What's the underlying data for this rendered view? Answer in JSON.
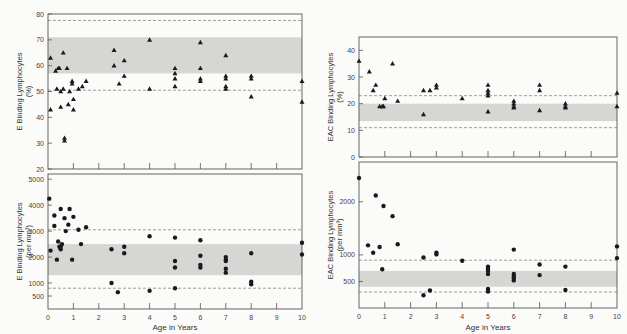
{
  "figure": {
    "x_axis_title": "Age in Years",
    "x_ticks": [
      "0",
      "1",
      "2",
      "3",
      "4",
      "5",
      "6",
      "7",
      "8",
      "9",
      "10"
    ]
  },
  "colors": {
    "band": "#d6d6d4",
    "frame": "#555555",
    "marker": "#1a1a1a",
    "dashed": "#777777",
    "background": "#fbfbf9"
  },
  "chart_data": [
    {
      "id": "e-percent",
      "type": "scatter",
      "marker": "triangle",
      "title": "",
      "ylabel": "E Binding Lymphocytes (%)",
      "ylabel_line1": "E  Binding Lymphocytes",
      "ylabel_line2": "(%)",
      "xlabel": "",
      "xlim": [
        0,
        10
      ],
      "ylim": [
        20,
        80
      ],
      "yticks": [
        20,
        30,
        40,
        50,
        60,
        70,
        80
      ],
      "band": [
        57,
        71
      ],
      "dashed": [
        77.5,
        50.5
      ],
      "points": [
        [
          0.1,
          63
        ],
        [
          0.1,
          43
        ],
        [
          0.3,
          58
        ],
        [
          0.35,
          51
        ],
        [
          0.4,
          59
        ],
        [
          0.45,
          59
        ],
        [
          0.5,
          44
        ],
        [
          0.5,
          50
        ],
        [
          0.6,
          65
        ],
        [
          0.6,
          51
        ],
        [
          0.65,
          32
        ],
        [
          0.65,
          31
        ],
        [
          0.75,
          59
        ],
        [
          0.8,
          45
        ],
        [
          0.85,
          50
        ],
        [
          0.95,
          54
        ],
        [
          0.95,
          53
        ],
        [
          1.0,
          47
        ],
        [
          1.0,
          43
        ],
        [
          1.2,
          51
        ],
        [
          1.35,
          52
        ],
        [
          1.5,
          54
        ],
        [
          2.6,
          66
        ],
        [
          2.6,
          60
        ],
        [
          2.8,
          53
        ],
        [
          3.0,
          62
        ],
        [
          3.0,
          56
        ],
        [
          4.0,
          70
        ],
        [
          4.0,
          51
        ],
        [
          5.0,
          59
        ],
        [
          5.0,
          57
        ],
        [
          5.0,
          55
        ],
        [
          5.0,
          52
        ],
        [
          6.0,
          69
        ],
        [
          6.0,
          59
        ],
        [
          6.0,
          55
        ],
        [
          6.0,
          54
        ],
        [
          7.0,
          64
        ],
        [
          7.0,
          56
        ],
        [
          7.0,
          55
        ],
        [
          7.0,
          52
        ],
        [
          7.0,
          51
        ],
        [
          8.0,
          56
        ],
        [
          8.0,
          55
        ],
        [
          8.0,
          48
        ],
        [
          10.0,
          54
        ],
        [
          10.0,
          46
        ]
      ]
    },
    {
      "id": "e-absolute",
      "type": "scatter",
      "marker": "circle",
      "title": "",
      "ylabel": "E Binding Lymphocytes (per mm3)",
      "ylabel_line1": "E  Binding Lymphocytes",
      "ylabel_line2": "(per mm³)",
      "xlabel": "Age in Years",
      "xlim": [
        0,
        10
      ],
      "ylim": [
        0,
        5200
      ],
      "yticks": [
        500,
        1000,
        2000,
        3000,
        4000,
        5000
      ],
      "band": [
        1300,
        2500
      ],
      "dashed": [
        3050,
        800
      ],
      "points": [
        [
          0.05,
          4250
        ],
        [
          0.1,
          2250
        ],
        [
          0.25,
          3600
        ],
        [
          0.25,
          3200
        ],
        [
          0.35,
          1900
        ],
        [
          0.4,
          2600
        ],
        [
          0.45,
          2400
        ],
        [
          0.5,
          2300
        ],
        [
          0.5,
          2400
        ],
        [
          0.5,
          3850
        ],
        [
          0.55,
          2500
        ],
        [
          0.65,
          3500
        ],
        [
          0.7,
          3000
        ],
        [
          0.8,
          3250
        ],
        [
          0.85,
          3850
        ],
        [
          0.95,
          1900
        ],
        [
          1.0,
          3550
        ],
        [
          1.2,
          3050
        ],
        [
          1.3,
          2500
        ],
        [
          1.5,
          3150
        ],
        [
          2.5,
          2300
        ],
        [
          2.5,
          1000
        ],
        [
          2.75,
          650
        ],
        [
          3.0,
          2400
        ],
        [
          3.0,
          2150
        ],
        [
          4.0,
          2800
        ],
        [
          4.0,
          700
        ],
        [
          5.0,
          2750
        ],
        [
          5.0,
          1850
        ],
        [
          5.0,
          1600
        ],
        [
          5.0,
          800
        ],
        [
          6.0,
          2650
        ],
        [
          6.0,
          2050
        ],
        [
          6.0,
          1700
        ],
        [
          6.0,
          1600
        ],
        [
          7.0,
          2000
        ],
        [
          7.0,
          1900
        ],
        [
          7.0,
          1850
        ],
        [
          7.0,
          1550
        ],
        [
          7.0,
          1400
        ],
        [
          8.0,
          2150
        ],
        [
          8.0,
          1050
        ],
        [
          8.0,
          950
        ],
        [
          10.0,
          2550
        ],
        [
          10.0,
          2100
        ]
      ]
    },
    {
      "id": "eac-percent",
      "type": "scatter",
      "marker": "triangle",
      "title": "",
      "ylabel": "EAC Binding Lymphocytes (%)",
      "ylabel_line1": "EAC  Binding Lymphocytes",
      "ylabel_line2": "(%)",
      "xlabel": "",
      "xlim": [
        0,
        10
      ],
      "ylim": [
        0,
        45
      ],
      "yticks": [
        0,
        10,
        20,
        30,
        40
      ],
      "band": [
        13.5,
        20
      ],
      "dashed": [
        23,
        11
      ],
      "points": [
        [
          0.0,
          36
        ],
        [
          0.4,
          32
        ],
        [
          0.55,
          25
        ],
        [
          0.65,
          27
        ],
        [
          0.8,
          19
        ],
        [
          0.9,
          19
        ],
        [
          0.95,
          19
        ],
        [
          1.0,
          22
        ],
        [
          1.3,
          35
        ],
        [
          1.5,
          21
        ],
        [
          2.5,
          25
        ],
        [
          2.5,
          16
        ],
        [
          2.75,
          25
        ],
        [
          3.0,
          27
        ],
        [
          3.0,
          26
        ],
        [
          4.0,
          22
        ],
        [
          5.0,
          27
        ],
        [
          5.0,
          25
        ],
        [
          5.0,
          24
        ],
        [
          5.0,
          23
        ],
        [
          5.0,
          17
        ],
        [
          6.0,
          21
        ],
        [
          6.0,
          20
        ],
        [
          6.0,
          19
        ],
        [
          6.0,
          18.5
        ],
        [
          7.0,
          27
        ],
        [
          7.0,
          25
        ],
        [
          7.0,
          17.5
        ],
        [
          8.0,
          20
        ],
        [
          8.0,
          19
        ],
        [
          8.0,
          18.5
        ],
        [
          10.0,
          24
        ],
        [
          10.0,
          19
        ]
      ]
    },
    {
      "id": "eac-absolute",
      "type": "scatter",
      "marker": "circle",
      "title": "",
      "ylabel": "EAC Binding Lymphocytes (per mm3)",
      "ylabel_line1": "EAC  Binding Lymphocytes",
      "ylabel_line2": "(per mm³)",
      "xlabel": "Age in Years",
      "xlim": [
        0,
        10
      ],
      "ylim": [
        0,
        2750
      ],
      "yticks": [
        500,
        1000,
        2000
      ],
      "band": [
        400,
        700
      ],
      "dashed": [
        900,
        300
      ],
      "points": [
        [
          0.0,
          2450
        ],
        [
          0.35,
          1180
        ],
        [
          0.55,
          1040
        ],
        [
          0.65,
          2120
        ],
        [
          0.8,
          1150
        ],
        [
          0.9,
          730
        ],
        [
          0.95,
          1920
        ],
        [
          1.3,
          1730
        ],
        [
          1.5,
          1200
        ],
        [
          2.5,
          950
        ],
        [
          2.5,
          240
        ],
        [
          2.75,
          330
        ],
        [
          3.0,
          1040
        ],
        [
          3.0,
          1010
        ],
        [
          4.0,
          890
        ],
        [
          5.0,
          780
        ],
        [
          5.0,
          740
        ],
        [
          5.0,
          700
        ],
        [
          5.0,
          640
        ],
        [
          5.0,
          360
        ],
        [
          5.0,
          310
        ],
        [
          6.0,
          1100
        ],
        [
          6.0,
          640
        ],
        [
          6.0,
          600
        ],
        [
          6.0,
          560
        ],
        [
          6.0,
          520
        ],
        [
          7.0,
          820
        ],
        [
          7.0,
          620
        ],
        [
          8.0,
          780
        ],
        [
          8.0,
          340
        ],
        [
          10.0,
          1160
        ],
        [
          10.0,
          940
        ]
      ]
    }
  ]
}
